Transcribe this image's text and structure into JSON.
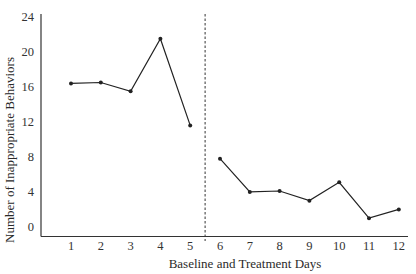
{
  "chart_data": {
    "type": "line",
    "title": "",
    "xlabel": "Baseline and Treatment Days",
    "ylabel": "Number of Inappropriate Behaviors",
    "yticks": [
      0,
      4,
      8,
      12,
      16,
      20,
      24
    ],
    "ylim": [
      0,
      24
    ],
    "xticks": [
      1,
      2,
      3,
      4,
      5,
      6,
      7,
      8,
      9,
      10,
      11,
      12
    ],
    "xlim": [
      0.5,
      12.3
    ],
    "grid": false,
    "legend": null,
    "phase_change_line": {
      "x": 5.5,
      "style": "dashed",
      "label": ""
    },
    "series": [
      {
        "name": "Baseline",
        "x": [
          1,
          2,
          3,
          4,
          5
        ],
        "values": [
          16.3,
          16.4,
          15.4,
          21.4,
          11.5
        ]
      },
      {
        "name": "Treatment",
        "x": [
          6,
          7,
          8,
          9,
          10,
          11,
          12
        ],
        "values": [
          7.7,
          3.9,
          4.0,
          2.9,
          5.0,
          0.9,
          1.9
        ]
      }
    ],
    "colors": {
      "line": "#222222",
      "axis": "#333333"
    }
  }
}
